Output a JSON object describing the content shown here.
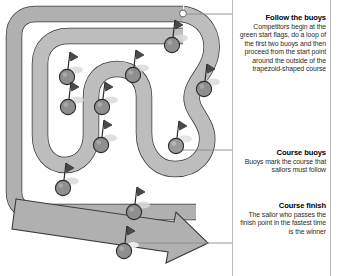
{
  "diagram": {
    "colors": {
      "course_band": "#b0b0b0",
      "course_band_inner": "#bdbdbd",
      "course_outline": "#3a3a3a",
      "buoy_fill": "#8f8f8f",
      "buoy_outline": "#2b2b2b",
      "flag_fill": "#3a3a3a",
      "arrow_fill": "#b0b0b0",
      "leader_line": "#8a8a8a",
      "start_marker": "#ffffff",
      "background": "#ffffff"
    },
    "elements": {
      "course_path_label": "trapezoid-shaped course with serpentine inner legs",
      "start_marker_label": "green start flags",
      "finish_arrow_label": "course finish direction arrow"
    },
    "buoys": [
      {
        "id": "buoy-1",
        "cx": 67,
        "cy": 77
      },
      {
        "id": "buoy-2",
        "cx": 68,
        "cy": 107
      },
      {
        "id": "buoy-3",
        "cx": 102,
        "cy": 107
      },
      {
        "id": "buoy-4",
        "cx": 101,
        "cy": 145
      },
      {
        "id": "buoy-5",
        "cx": 133,
        "cy": 75
      },
      {
        "id": "buoy-6",
        "cx": 172,
        "cy": 45
      },
      {
        "id": "buoy-7",
        "cx": 204,
        "cy": 89
      },
      {
        "id": "buoy-8",
        "cx": 176,
        "cy": 146
      },
      {
        "id": "buoy-9",
        "cx": 63,
        "cy": 188
      },
      {
        "id": "buoy-10",
        "cx": 134,
        "cy": 212
      },
      {
        "id": "buoy-11",
        "cx": 124,
        "cy": 251
      }
    ],
    "leader_lines": [
      {
        "id": "leader-start",
        "y": 14,
        "x1": 186,
        "x2": 341
      },
      {
        "id": "leader-buoys",
        "y": 150,
        "x1": 182,
        "x2": 341
      },
      {
        "id": "leader-finish",
        "y": 243,
        "x1": 130,
        "x2": 341
      }
    ]
  },
  "panel": {
    "notes": [
      {
        "id": "note-follow",
        "heading": "Follow the buoys",
        "body": "Competitors begin at the green start flags, do a loop of the first two buoys and then proceed from the start point around the outside of the trapezoid-shaped course"
      },
      {
        "id": "note-buoys",
        "heading": "Course buoys",
        "body": "Buoys mark the course that sailors must follow"
      },
      {
        "id": "note-finish",
        "heading": "Course finish",
        "body": "The sailor who passes the finish point in the fastest time is the winner"
      }
    ]
  }
}
